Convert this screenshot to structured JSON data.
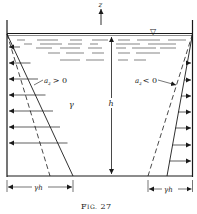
{
  "figure": {
    "caption": "FIG. 27",
    "caption_prefix": "F",
    "caption_smallcaps": "IG.",
    "caption_number": "27",
    "axis_label": "z",
    "height_label": "h",
    "density_label": "γ",
    "surface_symbol": "▽",
    "left_label": {
      "var": "a",
      "sub": "z",
      "relation": "> 0"
    },
    "right_label": {
      "var": "a",
      "sub": "z",
      "relation": "< 0"
    },
    "left_dimension": "γh",
    "right_dimension": "γh"
  },
  "geometry": {
    "container": {
      "left": 7,
      "right": 192,
      "top": 20,
      "surface": 34,
      "bottom": 176
    },
    "left_arrows_y": [
      63,
      79,
      95,
      111,
      127,
      143,
      159
    ],
    "right_arrows_y": [
      63,
      80,
      96,
      112,
      128,
      145,
      161
    ]
  },
  "colors": {
    "ink": "#1a1a1a",
    "background": "#ffffff"
  }
}
